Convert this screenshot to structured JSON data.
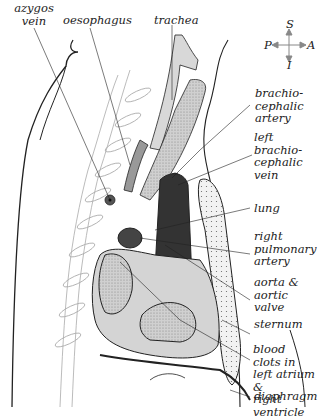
{
  "figure": {
    "orientation": {
      "superior": "S",
      "inferior": "I",
      "posterior": "P",
      "anterior": "A"
    },
    "labels_top": [
      {
        "id": "azygos",
        "text": "azygos\nvein"
      },
      {
        "id": "oesophagus",
        "text": "oesophagus"
      },
      {
        "id": "trachea",
        "text": "trachea"
      }
    ],
    "labels_right": [
      {
        "id": "brachiocephalic_artery",
        "text": "brachio-\ncephalic\nartery"
      },
      {
        "id": "left_brachiocephalic_vein",
        "text": "left\nbrachio-\ncephalic\nvein"
      },
      {
        "id": "lung",
        "text": "lung"
      },
      {
        "id": "right_pulmonary_artery",
        "text": "right\npulmonary\nartery"
      },
      {
        "id": "aorta",
        "text": "aorta &\naortic\nvalve"
      },
      {
        "id": "sternum",
        "text": "sternum"
      },
      {
        "id": "blood_clots",
        "text": "blood clots in\nleft atrium &\nright ventricle"
      },
      {
        "id": "diaphragm",
        "text": "diaphragm"
      }
    ],
    "colors": {
      "line": "#222222",
      "light_fill": "#e2e2e2",
      "mid_fill": "#b8b8b8",
      "dark_fill": "#333333",
      "bone_fill": "#f4f4f4"
    }
  }
}
